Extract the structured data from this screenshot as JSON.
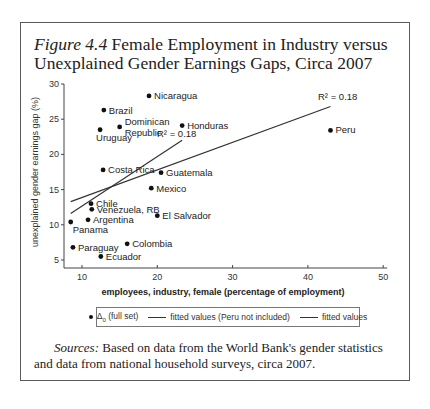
{
  "figure": {
    "number": "Figure 4.4",
    "title": "Female Employment in Industry versus Unexplained Gender Earnings Gaps, Circa 2007"
  },
  "sources": {
    "label": "Sources:",
    "text": "Based on data from the World Bank's gender statistics and data from national household surveys, circa 2007."
  },
  "legend": {
    "points_label": "Δ",
    "points_sub": "0",
    "points_suffix": " (full set)",
    "line1_label": "fitted values (Peru not included)",
    "line2_label": "fitted values"
  },
  "annotations": {
    "r2_peru_excluded": "R² = 0.18",
    "r2_full": "R² = 0.18"
  },
  "chart_data": {
    "type": "scatter",
    "title": "Female Employment in Industry versus Unexplained Gender Earnings Gaps, Circa 2007",
    "xlabel": "employees, industry, female (percentage of employment)",
    "ylabel": "unexplained gender earnings gap (%)",
    "xlim": [
      8,
      50
    ],
    "ylim": [
      4,
      30
    ],
    "xticks": [
      10,
      20,
      30,
      40,
      50
    ],
    "yticks": [
      5,
      10,
      15,
      20,
      25,
      30
    ],
    "grid": false,
    "legend_position": "bottom",
    "series": [
      {
        "name": "Δ0 (full set)",
        "points": [
          {
            "label": "Nicaragua",
            "x": 18.9,
            "y": 28.3
          },
          {
            "label": "Brazil",
            "x": 12.9,
            "y": 26.3
          },
          {
            "label": "Dominican Republic",
            "x": 15.0,
            "y": 23.9
          },
          {
            "label": "Uruguay",
            "x": 12.4,
            "y": 23.5
          },
          {
            "label": "Honduras",
            "x": 23.3,
            "y": 24.1
          },
          {
            "label": "Peru",
            "x": 43.0,
            "y": 23.4
          },
          {
            "label": "Costa Rica",
            "x": 12.8,
            "y": 17.8
          },
          {
            "label": "Guatemala",
            "x": 20.5,
            "y": 17.4
          },
          {
            "label": "Mexico",
            "x": 19.2,
            "y": 15.2
          },
          {
            "label": "Chile",
            "x": 11.2,
            "y": 13.0
          },
          {
            "label": "Venezuela, RB",
            "x": 11.3,
            "y": 12.2
          },
          {
            "label": "El Salvador",
            "x": 20.0,
            "y": 11.3
          },
          {
            "label": "Argentina",
            "x": 10.8,
            "y": 10.7
          },
          {
            "label": "Panama",
            "x": 8.5,
            "y": 10.4
          },
          {
            "label": "Paraguay",
            "x": 8.8,
            "y": 6.8
          },
          {
            "label": "Colombia",
            "x": 16.0,
            "y": 7.3
          },
          {
            "label": "Ecuador",
            "x": 12.5,
            "y": 5.5
          }
        ]
      },
      {
        "name": "fitted values (Peru not included)",
        "type": "line",
        "x": [
          8.5,
          23.3
        ],
        "y": [
          11.6,
          22.0
        ],
        "r2": 0.18
      },
      {
        "name": "fitted values",
        "type": "line",
        "x": [
          8.5,
          43.0
        ],
        "y": [
          13.3,
          26.8
        ],
        "r2": 0.18
      }
    ]
  }
}
